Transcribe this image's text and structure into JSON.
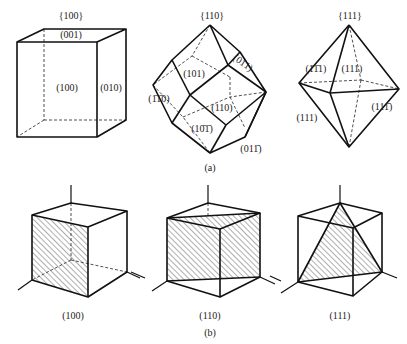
{
  "figure_a": {
    "caption": "(a)",
    "cube": {
      "family_label": "{100}",
      "faces": {
        "top": "(001)",
        "front": "(100)",
        "side": "(010)"
      }
    },
    "rhombic_dodecahedron": {
      "family_label": "{110}",
      "faces": {
        "upper_right": "(011)",
        "upper_left": "(101)",
        "left": "(1̄1̄0)",
        "center": "(110)",
        "lower_left": "(10̄1̄)",
        "lower_right": "(011̄)"
      }
    },
    "octahedron": {
      "family_label": "{111}",
      "faces": {
        "upper_left": "(1̄1̄1)",
        "upper_front": "(111)",
        "lower_left": "(111)",
        "lower_right": "(111̄)"
      }
    }
  },
  "figure_b": {
    "caption": "(b)",
    "planes": [
      {
        "label": "(100)"
      },
      {
        "label": "(110)"
      },
      {
        "label": "(111)"
      }
    ]
  }
}
